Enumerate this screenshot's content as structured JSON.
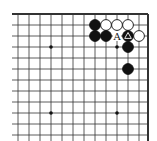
{
  "diagram": {
    "type": "go-board-fragment",
    "grid": {
      "columns": 13,
      "rows": 12,
      "x_positions": [
        18,
        29,
        40,
        51,
        62,
        73,
        84,
        95,
        106,
        117,
        128,
        139,
        148
      ],
      "y_positions": [
        14,
        25,
        36,
        47,
        58,
        69,
        80,
        91,
        102,
        113,
        124,
        135
      ],
      "top_edge": true,
      "right_edge": true,
      "line_color": "#333333"
    },
    "star_points": [
      {
        "x": 51,
        "y": 47
      },
      {
        "x": 117,
        "y": 47
      },
      {
        "x": 51,
        "y": 113
      },
      {
        "x": 117,
        "y": 113
      }
    ],
    "stones": [
      {
        "color": "black",
        "x": 95,
        "y": 25
      },
      {
        "color": "white",
        "x": 106,
        "y": 25
      },
      {
        "color": "white",
        "x": 117,
        "y": 25
      },
      {
        "color": "white",
        "x": 128,
        "y": 25
      },
      {
        "color": "black",
        "x": 95,
        "y": 36
      },
      {
        "color": "black",
        "x": 106,
        "y": 36
      },
      {
        "color": "black",
        "x": 128,
        "y": 36,
        "marker": "triangle"
      },
      {
        "color": "white",
        "x": 139,
        "y": 36
      },
      {
        "color": "black",
        "x": 128,
        "y": 47
      },
      {
        "color": "black",
        "x": 128,
        "y": 69
      }
    ],
    "labels": [
      {
        "text": "A",
        "x": 117,
        "y": 36
      }
    ]
  }
}
